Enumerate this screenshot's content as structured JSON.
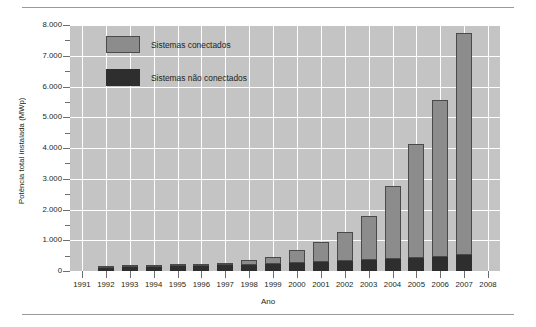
{
  "chart_data": {
    "type": "bar",
    "stacked": true,
    "title": "",
    "xlabel": "Ano",
    "ylabel": "Potência total instalada (MWp)",
    "categories": [
      "1991",
      "1992",
      "1993",
      "1994",
      "1995",
      "1996",
      "1997",
      "1998",
      "1999",
      "2000",
      "2001",
      "2002",
      "2003",
      "2004",
      "2005",
      "2006",
      "2007",
      "2008"
    ],
    "xtick_labels": [
      "1991",
      "1992",
      "1993",
      "1994",
      "1995",
      "1996",
      "1997",
      "1998",
      "1999",
      "2000",
      "2001",
      "2002",
      "2003",
      "2004",
      "2005",
      "2006",
      "2007",
      "2008"
    ],
    "ytick_labels": [
      "0",
      "1.000",
      "2.000",
      "3.000",
      "4.000",
      "5.000",
      "6.000",
      "7.000",
      "8.000"
    ],
    "ytick_values": [
      0,
      1000,
      2000,
      3000,
      4000,
      5000,
      6000,
      7000,
      8000
    ],
    "yminor_values": [
      500,
      1500,
      2500,
      3500,
      4500,
      5500,
      6500,
      7500
    ],
    "ylim": [
      0,
      8000
    ],
    "grid": true,
    "legend_position": "upper-left-inside",
    "series": [
      {
        "name": "Sistemas não conectados",
        "color": "#2e2e2e",
        "values": [
          0,
          110,
          120,
          135,
          150,
          165,
          185,
          210,
          240,
          270,
          300,
          330,
          360,
          395,
          430,
          470,
          520,
          0
        ]
      },
      {
        "name": "Sistemas conectados",
        "color": "#8c8c8c",
        "values": [
          0,
          20,
          25,
          30,
          40,
          55,
          85,
          140,
          230,
          420,
          650,
          950,
          1420,
          2385,
          3700,
          5080,
          7230,
          0
        ]
      }
    ],
    "totals": [
      0,
      130,
      145,
      165,
      190,
      220,
      270,
      350,
      470,
      690,
      950,
      1280,
      1780,
      2780,
      4130,
      5550,
      7750,
      0
    ],
    "plot_background": "#c4c4c4",
    "gridline_color": "#ffffff"
  },
  "legend": {
    "connected": "Sistemas conectados",
    "not_connected": "Sistemas não conectados"
  }
}
